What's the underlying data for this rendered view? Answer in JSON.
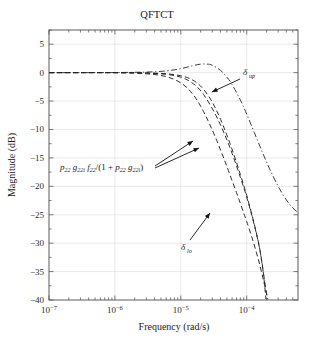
{
  "chart_data": {
    "type": "line",
    "title": "QFTCT",
    "xlabel": "Frequency (rad/s)",
    "ylabel": "Magnitude (dB)",
    "xscale": "log",
    "xlim": [
      1e-07,
      0.0006
    ],
    "ylim": [
      -40,
      7.5
    ],
    "grid": true,
    "legend_position": "none",
    "xticks": [
      {
        "value": 1e-07,
        "mantissa": "10",
        "exponent": "−7"
      },
      {
        "value": 1e-06,
        "mantissa": "10",
        "exponent": "−6"
      },
      {
        "value": 1e-05,
        "mantissa": "10",
        "exponent": "−5"
      },
      {
        "value": 0.0001,
        "mantissa": "10",
        "exponent": "−4"
      }
    ],
    "yticks": [
      5,
      0,
      -5,
      -10,
      -15,
      -20,
      -25,
      -30,
      -35,
      -40
    ],
    "ytick_labels": [
      "5",
      "0",
      "−5",
      "−10",
      "−15",
      "−20",
      "−25",
      "−30",
      "−35",
      "−40"
    ],
    "series": [
      {
        "name": "delta_up",
        "style": "dash-dot",
        "color": "#333333",
        "x": [
          1e-07,
          3e-07,
          1e-06,
          3e-06,
          6e-06,
          1e-05,
          1.5e-05,
          2e-05,
          2.5e-05,
          3e-05,
          4e-05,
          5e-05,
          6e-05,
          8e-05,
          0.0001,
          0.00013,
          0.00017,
          0.00022,
          0.0003,
          0.0004,
          0.0005,
          0.0006
        ],
        "y": [
          0.0,
          0.0,
          0.02,
          0.1,
          0.3,
          0.7,
          1.2,
          1.5,
          1.5,
          1.3,
          0.4,
          -0.8,
          -2.1,
          -4.8,
          -7.3,
          -10.5,
          -13.8,
          -16.8,
          -20.0,
          -22.4,
          -23.8,
          -24.6
        ]
      },
      {
        "name": "p22 g22i f22/(1+p22 g22i) case 1",
        "style": "dashed",
        "color": "#222222",
        "x": [
          1e-07,
          1e-06,
          3e-06,
          6e-06,
          1e-05,
          1.4e-05,
          1.8e-05,
          2.2e-05,
          2.8e-05,
          3.4e-05,
          4e-05,
          4.6e-05,
          5.2e-05,
          6e-05,
          7e-05,
          8e-05,
          9e-05,
          0.0001,
          0.00012,
          0.00014,
          0.00016,
          0.00018,
          0.000195
        ],
        "y": [
          0.0,
          0.0,
          -0.05,
          -0.2,
          -0.55,
          -1.1,
          -1.9,
          -2.9,
          -4.6,
          -6.4,
          -8.2,
          -9.9,
          -11.5,
          -13.5,
          -15.8,
          -17.9,
          -19.8,
          -21.6,
          -25.0,
          -28.2,
          -31.4,
          -35.5,
          -39.8
        ]
      },
      {
        "name": "p22 g22i f22/(1+p22 g22i) case 2",
        "style": "dashed",
        "color": "#222222",
        "x": [
          1e-07,
          1e-06,
          3e-06,
          6e-06,
          1e-05,
          1.4e-05,
          1.8e-05,
          2.2e-05,
          2.8e-05,
          3.4e-05,
          4e-05,
          4.6e-05,
          5.2e-05,
          6e-05,
          7e-05,
          8e-05,
          9e-05,
          0.0001,
          0.00012,
          0.00014,
          0.00016,
          0.00018,
          0.000205
        ],
        "y": [
          0.0,
          0.0,
          -0.08,
          -0.3,
          -0.8,
          -1.6,
          -2.6,
          -3.8,
          -5.7,
          -7.5,
          -9.2,
          -10.8,
          -12.3,
          -14.2,
          -16.4,
          -18.4,
          -20.2,
          -21.9,
          -25.2,
          -28.3,
          -31.5,
          -35.4,
          -39.8
        ]
      },
      {
        "name": "delta_lo",
        "style": "dashed",
        "color": "#222222",
        "x": [
          1e-07,
          1e-06,
          3e-06,
          6e-06,
          1e-05,
          1.4e-05,
          1.8e-05,
          2.2e-05,
          2.6e-05,
          3e-05,
          3.5e-05,
          4e-05,
          4.5e-05,
          5e-05,
          6e-05,
          7e-05,
          8e-05,
          9e-05,
          0.0001,
          0.00012,
          0.00014,
          0.00016,
          0.00018,
          0.00021
        ],
        "y": [
          0.0,
          -0.02,
          -0.2,
          -0.7,
          -1.8,
          -3.3,
          -5.0,
          -6.8,
          -8.5,
          -10.1,
          -11.9,
          -13.6,
          -15.1,
          -16.5,
          -19.0,
          -21.1,
          -23.0,
          -24.7,
          -26.2,
          -29.0,
          -31.6,
          -34.1,
          -36.6,
          -39.9
        ]
      }
    ],
    "annotations": [
      {
        "name": "delta-up-label",
        "text": "δup",
        "base": "δ",
        "sub": "up",
        "x_px": 243,
        "y_px": 75,
        "arrow_from": [
          240,
          79
        ],
        "arrow_to": [
          212,
          92
        ]
      },
      {
        "name": "delta-lo-label",
        "text": "δlo",
        "base": "δ",
        "sub": "lo",
        "x_px": 186,
        "y_px": 247,
        "arrow_from": [
          190,
          240
        ],
        "arrow_to": [
          210,
          213
        ]
      },
      {
        "name": "transfer-function-label",
        "text": "p22 g22i f22/(1 + p22 g22i)",
        "x_px": 62,
        "y_px": 170,
        "arrow1_from": [
          155,
          166
        ],
        "arrow1_to": [
          193,
          141
        ],
        "arrow2_from": [
          155,
          168
        ],
        "arrow2_to": [
          199,
          148
        ]
      }
    ]
  }
}
